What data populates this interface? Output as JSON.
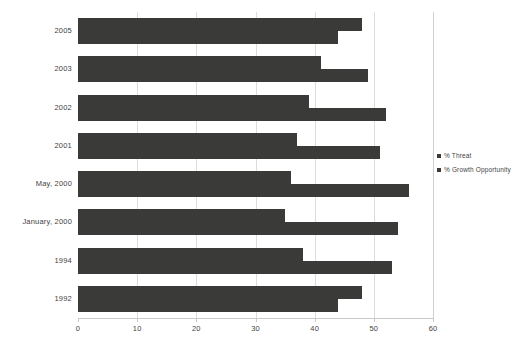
{
  "chart_data": {
    "type": "bar",
    "orientation": "horizontal",
    "title": "",
    "xlabel": "",
    "ylabel": "",
    "xlim": [
      0,
      60
    ],
    "xticks": [
      0,
      10,
      20,
      30,
      40,
      50,
      60
    ],
    "grid": true,
    "legend_position": "right",
    "bar_color": "#3a3a38",
    "categories": [
      "2005",
      "2003",
      "2002",
      "2001",
      "May, 2000",
      "January, 2000",
      "1994",
      "1992"
    ],
    "series": [
      {
        "name": "% Threat",
        "values": [
          48,
          41,
          39,
          37,
          36,
          35,
          38,
          48
        ]
      },
      {
        "name": "% Growth Opportunity",
        "values": [
          44,
          49,
          52,
          51,
          56,
          54,
          53,
          44
        ]
      }
    ]
  },
  "legend": {
    "items": [
      {
        "label": "% Threat",
        "color": "#3a3a38"
      },
      {
        "label": "% Growth Opportunity",
        "color": "#3a3a38"
      }
    ]
  }
}
